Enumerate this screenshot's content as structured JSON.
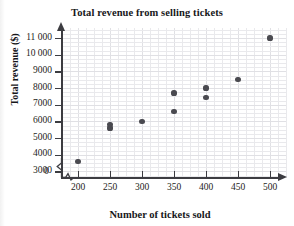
{
  "chart_data": {
    "type": "scatter",
    "title": "Total revenue from selling tickets",
    "xlabel": "Number of tickets sold",
    "ylabel": "Total revenue ($)",
    "origin_label": "0",
    "grid": true,
    "legend": "none",
    "xlim": [
      175,
      525
    ],
    "ylim": [
      2600,
      11600
    ],
    "x_ticks": [
      200,
      250,
      300,
      350,
      400,
      450,
      500
    ],
    "x_tick_labels": [
      "200",
      "250",
      "300",
      "350",
      "400",
      "450",
      "500"
    ],
    "y_ticks": [
      3000,
      4000,
      5000,
      6000,
      7000,
      8000,
      9000,
      10000,
      11000
    ],
    "y_tick_labels": [
      "3000",
      "4000",
      "5000",
      "6000",
      "7000",
      "8000",
      "9000",
      "10 000",
      "11 000"
    ],
    "axis_break_x": true,
    "axis_break_y": true,
    "point_color": "#4a4a50",
    "points": [
      {
        "x": 200,
        "y": 3600
      },
      {
        "x": 250,
        "y": 5600
      },
      {
        "x": 250,
        "y": 5800
      },
      {
        "x": 300,
        "y": 6000
      },
      {
        "x": 350,
        "y": 6600
      },
      {
        "x": 350,
        "y": 7700
      },
      {
        "x": 400,
        "y": 7450
      },
      {
        "x": 400,
        "y": 8000
      },
      {
        "x": 450,
        "y": 8500
      },
      {
        "x": 500,
        "y": 11000
      }
    ]
  }
}
